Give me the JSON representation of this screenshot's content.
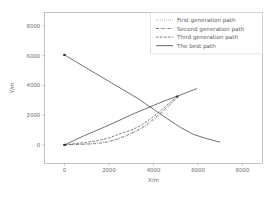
{
  "chart_data": {
    "type": "line",
    "title": "",
    "xlabel": "X/m",
    "ylabel": "Y/m",
    "xlim": [
      -900,
      8900
    ],
    "ylim": [
      -1250,
      8900
    ],
    "xticks": [
      0,
      2000,
      4000,
      6000,
      8000
    ],
    "yticks": [
      0,
      2000,
      4000,
      6000,
      8000
    ],
    "xtick_labels": [
      "0",
      "2000",
      "4000",
      "6000",
      "8000"
    ],
    "ytick_labels": [
      "0",
      "2000",
      "4000",
      "6000",
      "8000"
    ],
    "grid": false,
    "legend_position": "upper right",
    "series": [
      {
        "name": "First generation path",
        "style": "dotted",
        "color": "#555555",
        "points": [
          [
            0,
            0
          ],
          [
            430,
            40
          ],
          [
            900,
            70
          ],
          [
            1350,
            120
          ],
          [
            1800,
            200
          ],
          [
            2250,
            330
          ],
          [
            2700,
            560
          ],
          [
            3050,
            790
          ],
          [
            3350,
            980
          ],
          [
            3700,
            1300
          ],
          [
            4050,
            1700
          ],
          [
            4350,
            2080
          ],
          [
            4650,
            2520
          ],
          [
            4900,
            2900
          ],
          [
            5050,
            3140
          ]
        ]
      },
      {
        "name": "Second generation path",
        "style": "dashdot",
        "color": "#555555",
        "points": [
          [
            0,
            0
          ],
          [
            450,
            20
          ],
          [
            950,
            40
          ],
          [
            1450,
            90
          ],
          [
            1950,
            200
          ],
          [
            2400,
            400
          ],
          [
            2800,
            640
          ],
          [
            3150,
            880
          ],
          [
            3500,
            1180
          ],
          [
            3850,
            1550
          ],
          [
            4200,
            1980
          ],
          [
            4500,
            2380
          ],
          [
            4800,
            2810
          ],
          [
            5000,
            3090
          ],
          [
            5080,
            3190
          ]
        ]
      },
      {
        "name": "Third generation path",
        "style": "dashed",
        "color": "#444444",
        "points": [
          [
            0,
            0
          ],
          [
            500,
            90
          ],
          [
            1000,
            170
          ],
          [
            1500,
            290
          ],
          [
            2000,
            470
          ],
          [
            2400,
            700
          ],
          [
            2750,
            880
          ],
          [
            3100,
            1060
          ],
          [
            3450,
            1320
          ],
          [
            3800,
            1680
          ],
          [
            4150,
            2080
          ],
          [
            4450,
            2470
          ],
          [
            4750,
            2870
          ],
          [
            4980,
            3160
          ],
          [
            5060,
            3250
          ]
        ]
      },
      {
        "name": "The best path",
        "style": "solid",
        "color": "#3a3a3a",
        "points": [
          [
            0,
            6050
          ],
          [
            700,
            5420
          ],
          [
            1400,
            4800
          ],
          [
            2100,
            4180
          ],
          [
            2800,
            3560
          ],
          [
            3400,
            3030
          ],
          [
            3700,
            2700
          ],
          [
            4100,
            2300
          ],
          [
            4600,
            1780
          ],
          [
            5200,
            1190
          ],
          [
            5800,
            700
          ],
          [
            6400,
            420
          ],
          [
            7000,
            180
          ]
        ]
      },
      {
        "name": "best-path-outbound-segment",
        "style": "solid",
        "color": "#3a3a3a",
        "points": [
          [
            0,
            0
          ],
          [
            800,
            560
          ],
          [
            1700,
            1140
          ],
          [
            2450,
            1640
          ],
          [
            3100,
            2090
          ],
          [
            3800,
            2530
          ],
          [
            4500,
            2960
          ],
          [
            5200,
            3350
          ],
          [
            5950,
            3790
          ]
        ]
      }
    ],
    "markers": [
      {
        "name": "depot-node",
        "x": 0,
        "y": 6050
      },
      {
        "name": "origin-node",
        "x": 0,
        "y": 0
      },
      {
        "name": "upper-right-node",
        "x": 5060,
        "y": 3250
      }
    ]
  },
  "legend": {
    "entries": [
      {
        "label": "First generation path",
        "style": "dotted"
      },
      {
        "label": "Second generation path",
        "style": "dashdot"
      },
      {
        "label": "Third generation path",
        "style": "dashed"
      },
      {
        "label": "The best path",
        "style": "solid"
      }
    ]
  }
}
